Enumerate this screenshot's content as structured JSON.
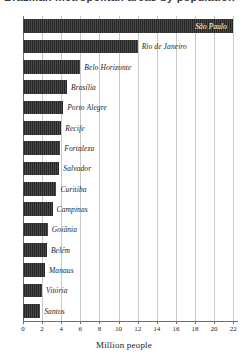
{
  "title": "Brazilian metropolitan areas by population",
  "axis": {
    "xlabel": "Million people",
    "ticks": [
      0,
      2,
      4,
      6,
      8,
      10,
      12,
      14,
      16,
      18,
      20,
      22
    ],
    "xmin": 0,
    "xmax": 22.5
  },
  "colors": {
    "bar": "#262626",
    "gridline": "#c9c9cc",
    "axis": "#6e6e72",
    "label": "#1d1d1d",
    "inside_label": "#ffffff"
  },
  "chart_data": {
    "type": "bar",
    "orientation": "horizontal",
    "title": "Brazilian metropolitan areas by population",
    "xlabel": "Million people",
    "ylabel": "",
    "xlim": [
      0,
      22.5
    ],
    "grid": true,
    "legend": false,
    "categories": [
      "São Paulo",
      "Rio de Janeiro",
      "Belo Horizonte",
      "Brasília",
      "Porto Alegre",
      "Recife",
      "Fortaleza",
      "Salvador",
      "Curitiba",
      "Campinas",
      "Goiânia",
      "Belém",
      "Manaus",
      "Vitória",
      "Santos"
    ],
    "values": [
      22.0,
      12.0,
      6.0,
      4.6,
      4.2,
      4.0,
      3.9,
      3.8,
      3.5,
      3.1,
      2.6,
      2.5,
      2.3,
      2.0,
      1.8
    ]
  }
}
